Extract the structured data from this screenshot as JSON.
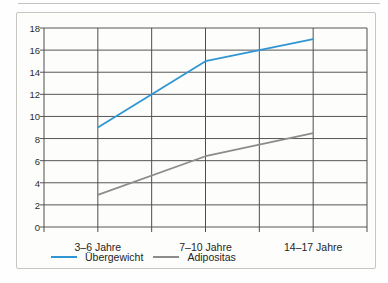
{
  "chart_data": {
    "type": "line",
    "title": "",
    "xlabel": "",
    "ylabel": "",
    "categories": [
      "3–6 Jahre",
      "7–10 Jahre",
      "14–17 Jahre"
    ],
    "series": [
      {
        "name": "Übergewicht",
        "values": [
          9,
          15,
          17
        ],
        "color": "#2f96d3"
      },
      {
        "name": "Adipositas",
        "values": [
          2.9,
          6.4,
          8.5
        ],
        "color": "#8c8c8c"
      }
    ],
    "ylim": [
      0,
      18
    ],
    "ytick_step": 2,
    "ytick_labels": [
      "18",
      "16",
      "14",
      "12",
      "10",
      "8",
      "6",
      "4",
      "2",
      "0"
    ],
    "grid": "both",
    "grid_color": "#565656",
    "legend_position": "bottom"
  }
}
